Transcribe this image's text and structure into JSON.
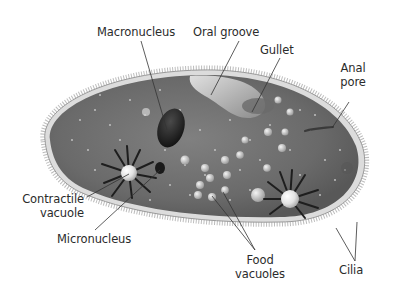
{
  "diagram": {
    "style": "grayscale illustration",
    "colors": {
      "background": "#ffffff",
      "cytoplasm": "#6e6e6e",
      "membrane": "#d8d8d8",
      "cilia": "#8a8a8a",
      "macronucleus": "#1f1f1f",
      "vacuole": "#e9e9e9",
      "label_text": "#2b2b2b",
      "leader_line": "#333333"
    },
    "labels": {
      "macronucleus": "Macronucleus",
      "oral_groove": "Oral groove",
      "gullet": "Gullet",
      "anal_pore_line1": "Anal",
      "anal_pore_line2": "pore",
      "contractile_vacuole_line1": "Contractile",
      "contractile_vacuole_line2": "vacuole",
      "micronucleus": "Micronucleus",
      "food_vacuoles_line1": "Food",
      "food_vacuoles_line2": "vacuoles",
      "cilia": "Cilia"
    }
  }
}
